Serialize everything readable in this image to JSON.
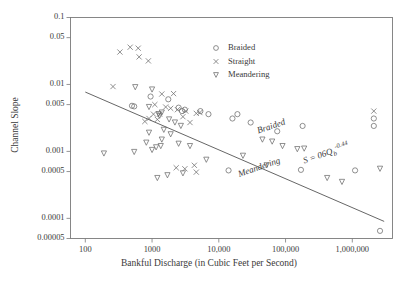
{
  "chart_data": {
    "type": "scatter",
    "title": "",
    "xlabel": "Bankful Discharge (in Cubic Feet per Second)",
    "ylabel": "Channel Slope",
    "xscale": "log",
    "yscale": "log",
    "xlim": [
      60,
      4000000
    ],
    "ylim": [
      5e-05,
      0.1
    ],
    "grid": false,
    "legend_position": "top-right-inside",
    "xtick_labels": [
      "100",
      "1000",
      "10,000",
      "100,000",
      "1,000,000"
    ],
    "xtick_values": [
      100,
      1000,
      10000,
      100000,
      1000000
    ],
    "ytick_labels": [
      "0.1",
      "0.05",
      "0.01",
      "0.005",
      "0.001",
      "0.0005",
      "0.0001",
      "0.00005"
    ],
    "ytick_values": [
      0.1,
      0.05,
      0.01,
      0.005,
      0.001,
      0.0005,
      0.0001,
      5e-05
    ],
    "annotations": [
      {
        "text": "Braided",
        "x": 60000,
        "y": 0.0022,
        "rotation": -19
      },
      {
        "text": "Meandering",
        "x": 40000,
        "y": 0.00055,
        "rotation": -19
      },
      {
        "text": "S = 06Q",
        "sub": "b",
        "sup": "-0.44",
        "x": 400000,
        "y": 0.00095,
        "rotation": -19
      }
    ],
    "trend_line": {
      "label": "S = 06Qb^-0.44",
      "x": [
        100,
        3000000
      ],
      "y": [
        0.0077,
        9e-05
      ]
    },
    "series": [
      {
        "name": "Braided",
        "marker": "circle",
        "points": [
          [
            950,
            0.0066
          ],
          [
            1750,
            0.006
          ],
          [
            2500,
            0.0045
          ],
          [
            3100,
            0.0042
          ],
          [
            540,
            0.0047
          ],
          [
            5300,
            0.004
          ],
          [
            7000,
            0.0036
          ],
          [
            16000,
            0.0031
          ],
          [
            19000,
            0.0036
          ],
          [
            1100000,
            0.00052
          ],
          [
            2600000,
            6.5e-05
          ],
          [
            170000,
            0.00053
          ],
          [
            500,
            0.0048
          ],
          [
            2100000,
            0.0031
          ],
          [
            2100000,
            0.0024
          ],
          [
            30000,
            0.0027
          ],
          [
            75000,
            0.002
          ],
          [
            180000,
            0.0024
          ],
          [
            14000,
            0.00052
          ],
          [
            2800,
            0.004
          ]
        ]
      },
      {
        "name": "Straight",
        "marker": "cross",
        "points": [
          [
            330,
            0.0305
          ],
          [
            470,
            0.036
          ],
          [
            620,
            0.0348
          ],
          [
            640,
            0.0258
          ],
          [
            880,
            0.0225
          ],
          [
            260,
            0.0093
          ],
          [
            1400,
            0.0072
          ],
          [
            2100,
            0.0073
          ],
          [
            1100,
            0.005
          ],
          [
            1600,
            0.0046
          ],
          [
            1900,
            0.0044
          ],
          [
            2400,
            0.0042
          ],
          [
            3200,
            0.004
          ],
          [
            5200,
            0.0038
          ],
          [
            900,
            0.0031
          ],
          [
            1200,
            0.003
          ],
          [
            780,
            0.0028
          ],
          [
            4600,
            0.0037
          ],
          [
            2900,
            0.0033
          ],
          [
            3700,
            0.0027
          ],
          [
            2300,
            0.00057
          ],
          [
            3100,
            0.00055
          ],
          [
            4300,
            0.00062
          ],
          [
            4600,
            0.00049
          ],
          [
            2100000,
            0.004
          ],
          [
            1300,
            0.0036
          ],
          [
            1050,
            0.0036
          ]
        ]
      },
      {
        "name": "Meandering",
        "marker": "triangle-down",
        "points": [
          [
            560,
            0.0091
          ],
          [
            1000,
            0.0084
          ],
          [
            900,
            0.0046
          ],
          [
            1400,
            0.0038
          ],
          [
            1250,
            0.0036
          ],
          [
            1300,
            0.0034
          ],
          [
            1800,
            0.003
          ],
          [
            2200,
            0.0027
          ],
          [
            2700,
            0.0024
          ],
          [
            1500,
            0.0021
          ],
          [
            1900,
            0.0018
          ],
          [
            190,
            0.00093
          ],
          [
            540,
            0.00098
          ],
          [
            1000,
            0.00105
          ],
          [
            1150,
            0.00115
          ],
          [
            1350,
            0.0012
          ],
          [
            820,
            0.00135
          ],
          [
            1400,
            0.0015
          ],
          [
            2500,
            0.0013
          ],
          [
            3700,
            0.0012
          ],
          [
            1200,
            0.0004
          ],
          [
            2900,
            0.00047
          ],
          [
            1700,
            0.00044
          ],
          [
            6500,
            0.00075
          ],
          [
            23000,
            0.00086
          ],
          [
            45000,
            0.0015
          ],
          [
            63000,
            0.0014
          ],
          [
            90000,
            0.0012
          ],
          [
            150000,
            0.00108
          ],
          [
            190000,
            0.0011
          ],
          [
            52000,
            0.00062
          ],
          [
            420000,
            0.0004
          ],
          [
            700000,
            0.00035
          ],
          [
            2600000,
            0.00055
          ],
          [
            900,
            0.0019
          ]
        ]
      }
    ]
  },
  "legend": {
    "items": [
      {
        "label": "Braided",
        "marker": "circle"
      },
      {
        "label": "Straight",
        "marker": "cross"
      },
      {
        "label": "Meandering",
        "marker": "triangle-down"
      }
    ]
  }
}
